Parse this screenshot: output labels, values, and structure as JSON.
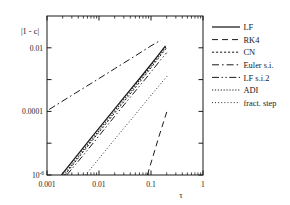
{
  "chart_data": {
    "type": "line",
    "title": "",
    "xlabel": "τ",
    "ylabel": "|1 - c|",
    "xscale": "log",
    "yscale": "log",
    "xlim": [
      0.001,
      1
    ],
    "ylim": [
      1e-06,
      0.1
    ],
    "grid": false,
    "legend_position": "right-outside",
    "xticks": [
      {
        "value": 0.001,
        "label": "0.001"
      },
      {
        "value": 0.01,
        "label": "0.01"
      },
      {
        "value": 0.1,
        "label": "0.1"
      },
      {
        "value": 1,
        "label": "1"
      }
    ],
    "yticks": [
      {
        "value": 0.01,
        "label": "0.01",
        "sup": ""
      },
      {
        "value": 0.0001,
        "label": "0.0001",
        "sup": ""
      },
      {
        "value": 1e-06,
        "label": "10",
        "sup": "-6"
      }
    ],
    "yminor": [
      0.001,
      1e-05
    ],
    "series": [
      {
        "name": "LF",
        "dash": "solid",
        "points": [
          [
            0.0019,
            1e-06
          ],
          [
            0.004,
            4.6e-06
          ],
          [
            0.008,
            1.9e-05
          ],
          [
            0.016,
            7.6e-05
          ],
          [
            0.032,
            0.00031
          ],
          [
            0.065,
            0.00125
          ],
          [
            0.13,
            0.0052
          ],
          [
            0.19,
            0.0115
          ]
        ]
      },
      {
        "name": "RK4",
        "dash": "dashed",
        "points": [
          [
            0.085,
            1e-06
          ],
          [
            0.11,
            4e-06
          ],
          [
            0.14,
            1.5e-05
          ],
          [
            0.18,
            5.5e-05
          ],
          [
            0.21,
            0.00012
          ]
        ]
      },
      {
        "name": "CN",
        "dash": "smalldash",
        "points": [
          [
            0.0022,
            1e-06
          ],
          [
            0.0045,
            4.4e-06
          ],
          [
            0.009,
            1.8e-05
          ],
          [
            0.018,
            7.2e-05
          ],
          [
            0.036,
            0.00029
          ],
          [
            0.072,
            0.00118
          ],
          [
            0.14,
            0.0048
          ],
          [
            0.2,
            0.01
          ]
        ]
      },
      {
        "name": "Euler s.i.",
        "dash": "dashdot",
        "points": [
          [
            0.0011,
            0.000115
          ],
          [
            0.003,
            0.00032
          ],
          [
            0.008,
            0.00086
          ],
          [
            0.02,
            0.0022
          ],
          [
            0.05,
            0.0056
          ],
          [
            0.1,
            0.0115
          ],
          [
            0.155,
            0.0175
          ]
        ]
      },
      {
        "name": "LF s.i.2",
        "dash": "dashdotdot",
        "points": [
          [
            0.0024,
            1e-06
          ],
          [
            0.005,
            4.2e-06
          ],
          [
            0.01,
            1.7e-05
          ],
          [
            0.02,
            7e-05
          ],
          [
            0.04,
            0.00028
          ],
          [
            0.08,
            0.0011
          ],
          [
            0.15,
            0.004
          ],
          [
            0.2,
            0.007
          ]
        ]
      },
      {
        "name": "ADI",
        "dash": "dotted",
        "points": [
          [
            0.0021,
            1e-06
          ],
          [
            0.0043,
            4.5e-06
          ],
          [
            0.0086,
            1.85e-05
          ],
          [
            0.017,
            7.4e-05
          ],
          [
            0.034,
            0.0003
          ],
          [
            0.068,
            0.00122
          ],
          [
            0.135,
            0.005
          ],
          [
            0.195,
            0.0108
          ]
        ]
      },
      {
        "name": "fract. step",
        "dash": "finedot",
        "points": [
          [
            0.0055,
            1e-06
          ],
          [
            0.011,
            4e-06
          ],
          [
            0.022,
            1.6e-05
          ],
          [
            0.045,
            6.5e-05
          ],
          [
            0.09,
            0.00026
          ],
          [
            0.16,
            0.0008
          ],
          [
            0.21,
            0.00135
          ]
        ]
      }
    ]
  },
  "legend": {
    "items": [
      {
        "label": "LF",
        "style": "solid"
      },
      {
        "label": "RK4",
        "style": "dashed"
      },
      {
        "label": "CN",
        "style": "smalldash"
      },
      {
        "label": "Euler s.i.",
        "style": "dashdot"
      },
      {
        "label": "LF s.i.2",
        "style": "dashdotdot"
      },
      {
        "label": "ADI",
        "style": "dotted"
      },
      {
        "label": "fract. step",
        "style": "finedot"
      }
    ]
  },
  "colors": {
    "axis": "#1a1a1a",
    "curve": "#1a1a1a",
    "background": "#ffffff"
  }
}
